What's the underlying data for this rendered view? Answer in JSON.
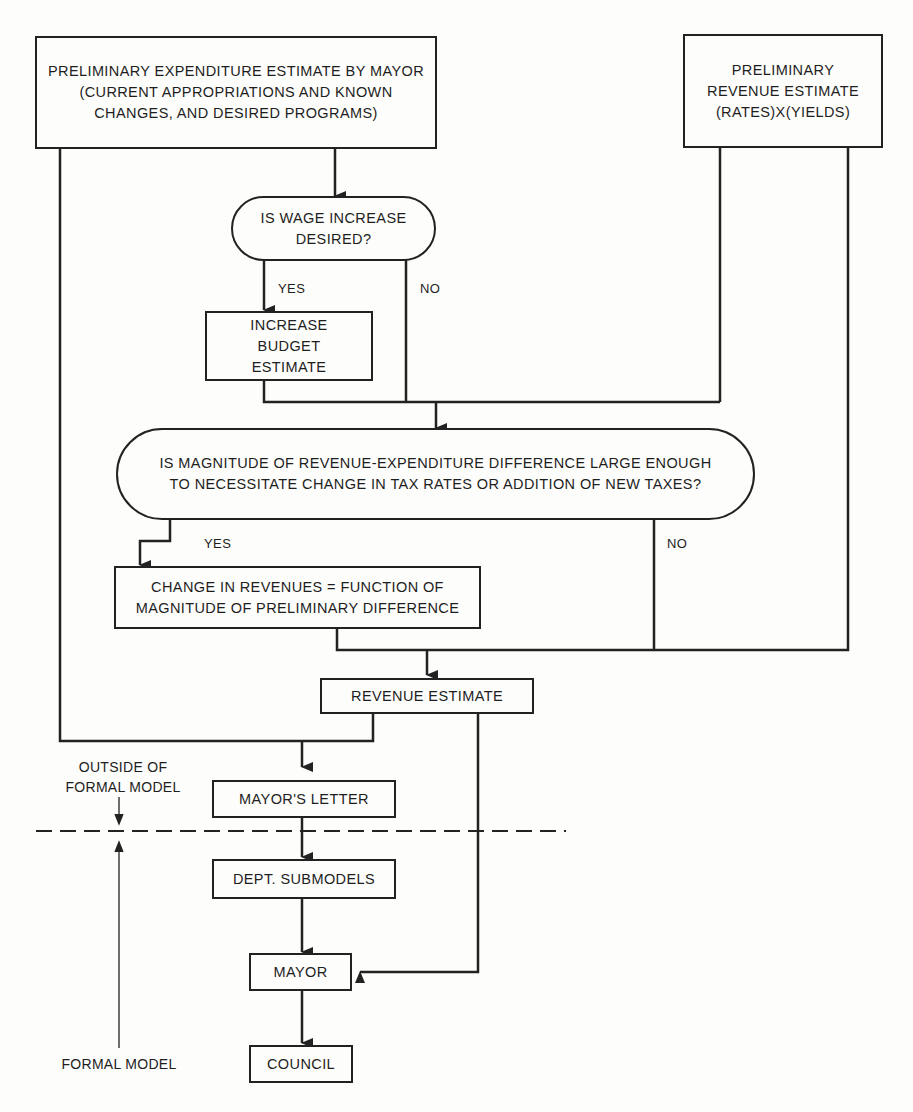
{
  "diagram": {
    "nodes": {
      "expenditure": "PRELIMINARY EXPENDITURE ESTIMATE BY MAYOR (CURRENT APPROPRIATIONS AND KNOWN CHANGES, AND DESIRED PROGRAMS)",
      "revenue_prelim": "PRELIMINARY REVENUE ESTIMATE (RATES)X(YIELDS)",
      "wage_question": "IS WAGE INCREASE DESIRED?",
      "increase_budget": "INCREASE BUDGET ESTIMATE",
      "magnitude_question": "IS MAGNITUDE OF REVENUE-EXPENDITURE DIFFERENCE LARGE ENOUGH TO NECESSITATE CHANGE IN TAX RATES OR ADDITION OF NEW TAXES?",
      "change_revenues": "CHANGE IN REVENUES = FUNCTION OF MAGNITUDE OF PRELIMINARY DIFFERENCE",
      "revenue_estimate": "REVENUE ESTIMATE",
      "mayors_letter": "MAYOR'S LETTER",
      "dept_submodels": "DEPT. SUBMODELS",
      "mayor": "MAYOR",
      "council": "COUNCIL"
    },
    "edge_labels": {
      "wage_yes": "YES",
      "wage_no": "NO",
      "magnitude_yes": "YES",
      "magnitude_no": "NO"
    },
    "annotations": {
      "outside": "OUTSIDE OF FORMAL MODEL",
      "formal": "FORMAL MODEL"
    }
  }
}
